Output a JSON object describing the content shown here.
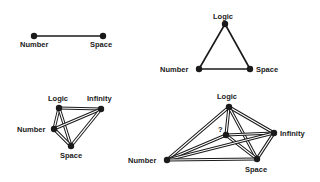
{
  "diagrams": [
    {
      "id": "d1",
      "edge_style": "single",
      "nodes": {
        "number": {
          "label": "Number",
          "x": 34,
          "y": 36
        },
        "space": {
          "label": "Space",
          "x": 103,
          "y": 36
        }
      },
      "edges": [
        [
          "number",
          "space"
        ]
      ]
    },
    {
      "id": "d2",
      "edge_style": "single",
      "nodes": {
        "logic": {
          "label": "Logic",
          "x": 225,
          "y": 24
        },
        "number": {
          "label": "Number",
          "x": 199,
          "y": 69
        },
        "space": {
          "label": "Space",
          "x": 250,
          "y": 69
        }
      },
      "edges": [
        [
          "logic",
          "number"
        ],
        [
          "logic",
          "space"
        ],
        [
          "number",
          "space"
        ]
      ]
    },
    {
      "id": "d3",
      "edge_style": "double",
      "nodes": {
        "logic": {
          "label": "Logic",
          "x": 59,
          "y": 108
        },
        "infinity": {
          "label": "Infinity",
          "x": 101,
          "y": 109
        },
        "number": {
          "label": "Number",
          "x": 54,
          "y": 129
        },
        "space": {
          "label": "Space",
          "x": 71,
          "y": 146
        }
      },
      "edges": [
        [
          "logic",
          "infinity"
        ],
        [
          "logic",
          "number"
        ],
        [
          "logic",
          "space"
        ],
        [
          "infinity",
          "number"
        ],
        [
          "infinity",
          "space"
        ],
        [
          "number",
          "space"
        ]
      ]
    },
    {
      "id": "d4",
      "edge_style": "double",
      "nodes": {
        "logic": {
          "label": "Logic",
          "x": 229,
          "y": 107
        },
        "unknown": {
          "label": "?",
          "x": 226,
          "y": 135
        },
        "infinity": {
          "label": "Infinity",
          "x": 274,
          "y": 133
        },
        "number": {
          "label": "Number",
          "x": 167,
          "y": 160
        },
        "space": {
          "label": "Space",
          "x": 257,
          "y": 159
        }
      },
      "edges": [
        [
          "logic",
          "unknown"
        ],
        [
          "logic",
          "infinity"
        ],
        [
          "logic",
          "number"
        ],
        [
          "logic",
          "space"
        ],
        [
          "unknown",
          "infinity"
        ],
        [
          "unknown",
          "number"
        ],
        [
          "unknown",
          "space"
        ],
        [
          "infinity",
          "number"
        ],
        [
          "infinity",
          "space"
        ],
        [
          "number",
          "space"
        ]
      ]
    }
  ],
  "labels": {
    "d1_number": "Number",
    "d1_space": "Space",
    "d2_logic": "Logic",
    "d2_number": "Number",
    "d2_space": "Space",
    "d3_logic": "Logic",
    "d3_infinity": "Infinity",
    "d3_number": "Number",
    "d3_space": "Space",
    "d4_logic": "Logic",
    "d4_unknown": "?",
    "d4_infinity": "Infinity",
    "d4_number": "Number",
    "d4_space": "Space"
  }
}
